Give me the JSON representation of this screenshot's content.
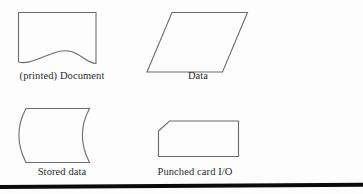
{
  "figure": {
    "kind": "flowchart-symbol-reference",
    "background_color": "#fdfdfd",
    "stroke_color": "#6b6b6b",
    "label_color": "#2b2b2b",
    "rule_color": "#0b0b0b",
    "symbols": [
      {
        "id": "document",
        "label": "(printed) Document",
        "shape_name": "document-wavy-bottom-rectangle",
        "icon_name": "document-symbol-icon"
      },
      {
        "id": "data",
        "label": "Data",
        "shape_name": "parallelogram",
        "icon_name": "data-symbol-icon"
      },
      {
        "id": "stored-data",
        "label": "Stored data",
        "shape_name": "curved-left-and-right-edges",
        "icon_name": "stored-data-symbol-icon"
      },
      {
        "id": "punched-card",
        "label": "Punched card I/O",
        "shape_name": "rectangle-with-clipped-top-left-corner",
        "icon_name": "punched-card-symbol-icon"
      }
    ]
  }
}
